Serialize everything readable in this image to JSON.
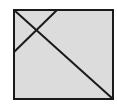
{
  "diagram": {
    "background": "#ffffff",
    "fill": "#dcdcdc",
    "stroke": "#1a1a1a",
    "square": {
      "x": 14,
      "y": 10,
      "width": 99,
      "height": 89
    },
    "lines": [
      {
        "name": "main-diagonal",
        "x1": 14,
        "y1": 10,
        "x2": 113,
        "y2": 99
      },
      {
        "name": "short-cross-line",
        "x1": 57,
        "y1": 10,
        "x2": 14,
        "y2": 52
      }
    ]
  }
}
